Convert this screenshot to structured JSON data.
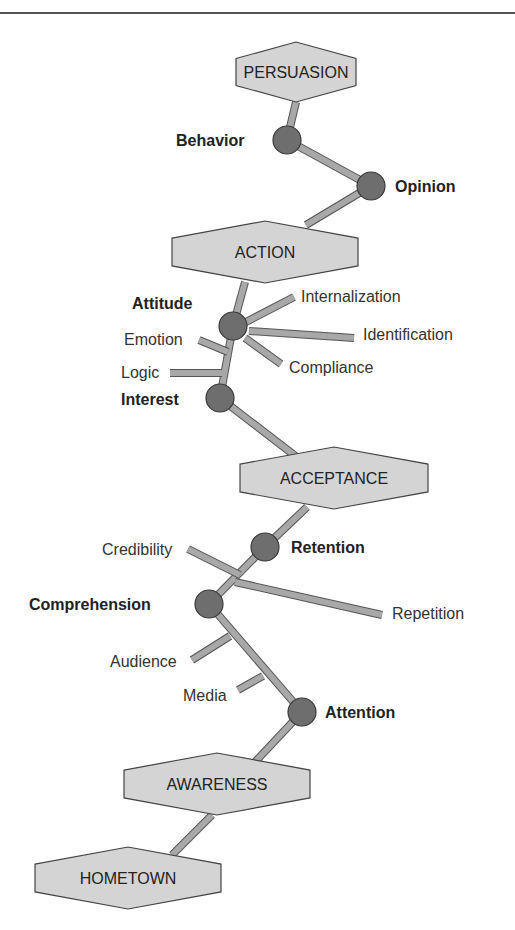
{
  "colors": {
    "stage_fill": "#d4d4d4",
    "stage_stroke": "#444444",
    "node_fill": "#6e6e6e",
    "node_stroke": "#3a3a3a",
    "connector_fill": "#a8a8a8",
    "connector_stroke": "#555555",
    "rule": "#555555"
  },
  "stages": [
    {
      "id": "persuasion",
      "label": "PERSUASION",
      "cx": 296,
      "cy": 72,
      "w": 120,
      "h": 60
    },
    {
      "id": "action",
      "label": "ACTION",
      "cx": 265,
      "cy": 252,
      "w": 186,
      "h": 62
    },
    {
      "id": "acceptance",
      "label": "ACCEPTANCE",
      "cx": 334,
      "cy": 478,
      "w": 188,
      "h": 62
    },
    {
      "id": "awareness",
      "label": "AWARENESS",
      "cx": 217,
      "cy": 784,
      "w": 186,
      "h": 62
    },
    {
      "id": "hometown",
      "label": "HOMETOWN",
      "cx": 128,
      "cy": 878,
      "w": 186,
      "h": 62
    }
  ],
  "nodes": [
    {
      "id": "behavior",
      "label": "Behavior",
      "cx": 287,
      "cy": 140,
      "label_x": 176,
      "label_y": 146
    },
    {
      "id": "opinion",
      "label": "Opinion",
      "cx": 371,
      "cy": 186,
      "label_x": 395,
      "label_y": 192
    },
    {
      "id": "attitude",
      "label": "Attitude",
      "cx": 233,
      "cy": 326,
      "label_x": 132,
      "label_y": 309
    },
    {
      "id": "interest",
      "label": "Interest",
      "cx": 220,
      "cy": 398,
      "label_x": 121,
      "label_y": 405
    },
    {
      "id": "retention",
      "label": "Retention",
      "cx": 265,
      "cy": 547,
      "label_x": 291,
      "label_y": 553
    },
    {
      "id": "comprehension",
      "label": "Comprehension",
      "cx": 209,
      "cy": 604,
      "label_x": 29,
      "label_y": 610
    },
    {
      "id": "attention",
      "label": "Attention",
      "cx": 302,
      "cy": 712,
      "label_x": 325,
      "label_y": 718
    }
  ],
  "factors": [
    {
      "label": "Internalization",
      "x": 301,
      "y": 302,
      "line": [
        244,
        323,
        294,
        297
      ]
    },
    {
      "label": "Identification",
      "x": 363,
      "y": 340,
      "line": [
        249,
        331,
        354,
        338
      ]
    },
    {
      "label": "Compliance",
      "x": 289,
      "y": 373,
      "line": [
        245,
        338,
        281,
        364
      ]
    },
    {
      "label": "Emotion",
      "x": 124,
      "y": 345,
      "line": [
        199,
        340,
        228,
        352
      ]
    },
    {
      "label": "Logic",
      "x": 121,
      "y": 378,
      "line": [
        170,
        373,
        222,
        373
      ]
    },
    {
      "label": "Credibility",
      "x": 102,
      "y": 555,
      "line": [
        188,
        549,
        240,
        575
      ]
    },
    {
      "label": "Repetition",
      "x": 392,
      "y": 619,
      "line": [
        235,
        582,
        382,
        615
      ]
    },
    {
      "label": "Audience",
      "x": 110,
      "y": 667,
      "line": [
        192,
        660,
        230,
        636
      ]
    },
    {
      "label": "Media",
      "x": 183,
      "y": 701,
      "line": [
        238,
        690,
        263,
        676
      ]
    }
  ],
  "links": [
    [
      296,
      102,
      287,
      140
    ],
    [
      287,
      140,
      371,
      186
    ],
    [
      371,
      186,
      306,
      225
    ],
    [
      245,
      282,
      233,
      326
    ],
    [
      233,
      326,
      220,
      398
    ],
    [
      220,
      398,
      298,
      458
    ],
    [
      307,
      507,
      265,
      547
    ],
    [
      265,
      547,
      209,
      604
    ],
    [
      209,
      604,
      302,
      712
    ],
    [
      302,
      712,
      255,
      762
    ],
    [
      212,
      815,
      172,
      855
    ]
  ]
}
